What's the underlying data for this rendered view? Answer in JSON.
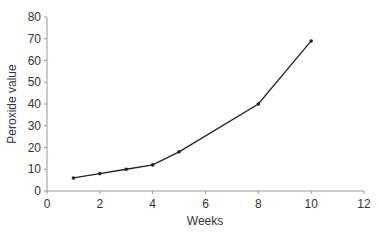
{
  "chart_data": {
    "type": "line",
    "title": "",
    "xlabel": "Weeks",
    "ylabel": "Peroxide value",
    "xlim": [
      0,
      12
    ],
    "ylim": [
      0,
      80
    ],
    "xticks": [
      0,
      2,
      4,
      6,
      8,
      10,
      12
    ],
    "yticks": [
      0,
      10,
      20,
      30,
      40,
      50,
      60,
      70,
      80
    ],
    "grid": false,
    "legend": null,
    "series": [
      {
        "name": "Peroxide value",
        "x": [
          1,
          2,
          3,
          4,
          5,
          8,
          10
        ],
        "values": [
          6,
          8,
          10,
          12,
          18,
          40,
          69
        ],
        "color": "#222222"
      }
    ]
  },
  "colors": {
    "axis": "#999999",
    "line": "#222222",
    "text": "#333333"
  }
}
